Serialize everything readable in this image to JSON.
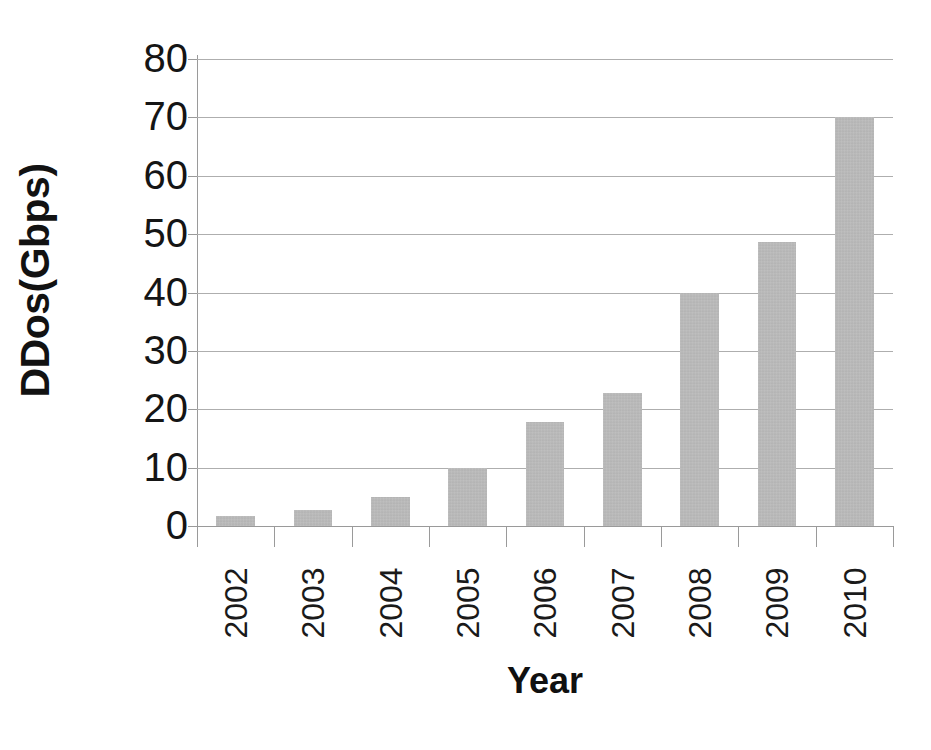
{
  "chart_data": {
    "type": "bar",
    "title": "",
    "xlabel": "Year",
    "ylabel": "DDos(Gbps)",
    "categories": [
      "2002",
      "2003",
      "2004",
      "2005",
      "2006",
      "2007",
      "2008",
      "2009",
      "2010"
    ],
    "values": [
      1.7,
      2.7,
      5.0,
      10.0,
      17.8,
      22.8,
      40.0,
      48.7,
      70.0
    ],
    "series": [
      {
        "name": "DDos(Gbps)",
        "values": [
          1.7,
          2.7,
          5.0,
          10.0,
          17.8,
          22.8,
          40.0,
          48.7,
          70.0
        ]
      }
    ],
    "ylim": [
      0,
      80
    ],
    "ytick_labels": [
      "80",
      "70",
      "60",
      "50",
      "40",
      "30",
      "20",
      "10",
      "0"
    ],
    "ytick_values": [
      80,
      70,
      60,
      50,
      40,
      30,
      20,
      10,
      0
    ],
    "ytick_step": 10,
    "grid": true,
    "grid_axis": "y",
    "legend": false,
    "legend_position": "none",
    "bar_color": "#b5b5b5",
    "gridline_color": "#aeaeae",
    "axis_color": "#9a9a9a",
    "text_color": "#121212",
    "background_color": "#ffffff",
    "xtick_label_rotation": 90
  },
  "axes": {
    "y_title": "DDos(Gbps)",
    "x_title": "Year"
  }
}
